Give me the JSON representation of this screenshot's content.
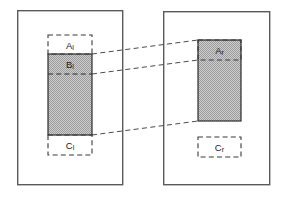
{
  "figure": {
    "type": "diagram",
    "title": "",
    "background_color": "#ffffff",
    "width": 283,
    "height": 197
  },
  "colors": {
    "panel_stroke": "#5a5a5a",
    "shaded_fill": "#b8b8b8",
    "shaded_stroke": "#2b2b2b",
    "dashed_stroke": "#3a3a3a",
    "connector_stroke": "#4a4a4a",
    "text": "#1a1a1a"
  },
  "panels": [
    {
      "name": "left-panel",
      "x": 17,
      "y": 10,
      "width": 106,
      "height": 175
    },
    {
      "name": "right-panel",
      "x": 163,
      "y": 11,
      "width": 107,
      "height": 174
    }
  ],
  "left_panel": {
    "regions": [
      {
        "key": "A",
        "label_base": "A",
        "label_sub": "l",
        "label_full": "Al",
        "style": "dashed",
        "x": 48,
        "y": 35,
        "width": 44,
        "height": 19
      },
      {
        "key": "B",
        "label_base": "B",
        "label_sub": "l",
        "label_full": "Bl",
        "style": "shaded",
        "x": 48,
        "y": 54,
        "width": 44,
        "height": 20
      },
      {
        "key": "body",
        "label_base": "",
        "label_sub": "",
        "label_full": "",
        "style": "shaded",
        "x": 48,
        "y": 74,
        "width": 44,
        "height": 61
      },
      {
        "key": "C",
        "label_base": "C",
        "label_sub": "l",
        "label_full": "Cl",
        "style": "dashed",
        "x": 48,
        "y": 135,
        "width": 44,
        "height": 20
      }
    ]
  },
  "right_panel": {
    "regions": [
      {
        "key": "A",
        "label_base": "A",
        "label_sub": "r",
        "label_full": "Ar",
        "style": "shaded-dashed",
        "x": 198,
        "y": 40,
        "width": 43,
        "height": 20
      },
      {
        "key": "body",
        "label_base": "",
        "label_sub": "",
        "label_full": "",
        "style": "shaded",
        "x": 198,
        "y": 60,
        "width": 43,
        "height": 61
      },
      {
        "key": "C",
        "label_base": "C",
        "label_sub": "r",
        "label_full": "Cr",
        "style": "dashed",
        "x": 198,
        "y": 137,
        "width": 43,
        "height": 20
      }
    ]
  },
  "connectors": [
    {
      "name": "connector-top",
      "x1": 92,
      "y1": 54,
      "x2": 198,
      "y2": 40
    },
    {
      "name": "connector-middle",
      "x1": 92,
      "y1": 74,
      "x2": 198,
      "y2": 60
    },
    {
      "name": "connector-bottom",
      "x1": 92,
      "y1": 135,
      "x2": 198,
      "y2": 121
    }
  ]
}
